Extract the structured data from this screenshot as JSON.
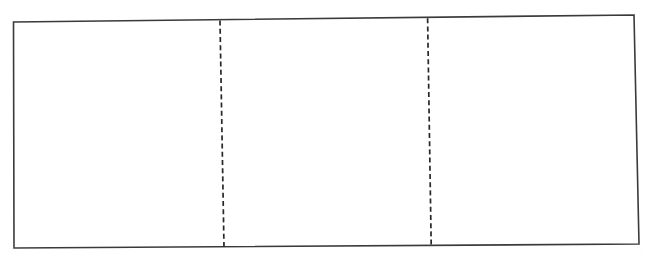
{
  "figure": {
    "kind": "hand-drawn-diagram",
    "canvas": {
      "width": 645,
      "height": 261
    },
    "background_color": "#ffffff",
    "outline": {
      "name": "outer-rectangle",
      "stroke_color": "#3a3a3a",
      "stroke_width": 1.6,
      "style": "solid",
      "points": [
        {
          "x": 13.5,
          "y": 22.0
        },
        {
          "x": 634.0,
          "y": 15.0
        },
        {
          "x": 639.0,
          "y": 244.0
        },
        {
          "x": 14.0,
          "y": 248.0
        }
      ]
    },
    "divider_lines": [
      {
        "name": "dashed-divider-left",
        "stroke_color": "#272727",
        "stroke_width": 1.7,
        "style": "dashed",
        "dash_length": 5,
        "gap_length": 3.2,
        "x1": 220.0,
        "y1": 20.6,
        "x2": 224.0,
        "y2": 247.2
      },
      {
        "name": "dashed-divider-right",
        "stroke_color": "#272727",
        "stroke_width": 1.7,
        "style": "dashed",
        "dash_length": 5,
        "gap_length": 3.2,
        "x1": 427.6,
        "y1": 18.2,
        "x2": 431.2,
        "y2": 245.4
      }
    ],
    "panels": [
      {
        "name": "panel-left",
        "index": 1
      },
      {
        "name": "panel-center",
        "index": 2
      },
      {
        "name": "panel-right",
        "index": 3
      }
    ]
  }
}
